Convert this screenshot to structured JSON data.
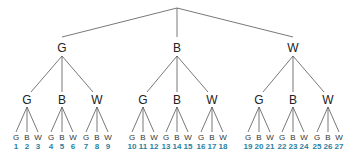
{
  "diagram": {
    "type": "tree",
    "root": {
      "label": ""
    },
    "level1": [
      {
        "label": "G",
        "x": 62
      },
      {
        "label": "B",
        "x": 177
      },
      {
        "label": "W",
        "x": 293
      }
    ],
    "level2": [
      {
        "label": "G",
        "x": 27
      },
      {
        "label": "B",
        "x": 62
      },
      {
        "label": "W",
        "x": 97
      },
      {
        "label": "G",
        "x": 143
      },
      {
        "label": "B",
        "x": 177
      },
      {
        "label": "W",
        "x": 212
      },
      {
        "label": "G",
        "x": 259
      },
      {
        "label": "B",
        "x": 293
      },
      {
        "label": "W",
        "x": 328
      }
    ],
    "leaves": [
      {
        "label": "G",
        "num": "1"
      },
      {
        "label": "B",
        "num": "2"
      },
      {
        "label": "W",
        "num": "3"
      },
      {
        "label": "G",
        "num": "4"
      },
      {
        "label": "B",
        "num": "5"
      },
      {
        "label": "W",
        "num": "6"
      },
      {
        "label": "G",
        "num": "7"
      },
      {
        "label": "B",
        "num": "8"
      },
      {
        "label": "W",
        "num": "9"
      },
      {
        "label": "G",
        "num": "10"
      },
      {
        "label": "B",
        "num": "11"
      },
      {
        "label": "W",
        "num": "12"
      },
      {
        "label": "G",
        "num": "13"
      },
      {
        "label": "B",
        "num": "14"
      },
      {
        "label": "W",
        "num": "15"
      },
      {
        "label": "G",
        "num": "16"
      },
      {
        "label": "B",
        "num": "17"
      },
      {
        "label": "W",
        "num": "18"
      },
      {
        "label": "G",
        "num": "19"
      },
      {
        "label": "B",
        "num": "20"
      },
      {
        "label": "W",
        "num": "21"
      },
      {
        "label": "G",
        "num": "22"
      },
      {
        "label": "B",
        "num": "23"
      },
      {
        "label": "W",
        "num": "24"
      },
      {
        "label": "G",
        "num": "25"
      },
      {
        "label": "B",
        "num": "26"
      },
      {
        "label": "W",
        "num": "27"
      }
    ],
    "colors": {
      "line": "#555555",
      "text": "#222222",
      "number": "#2a7fa0"
    }
  }
}
